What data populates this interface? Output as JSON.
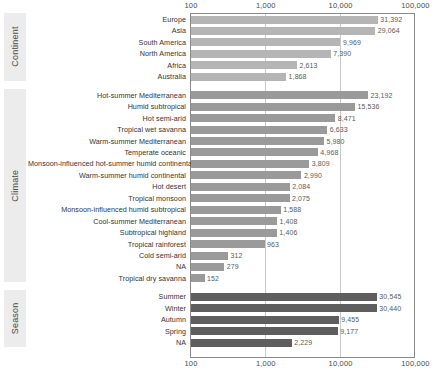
{
  "chart_data": {
    "type": "bar",
    "orientation": "horizontal",
    "title": "",
    "xlabel": "",
    "ylabel": "",
    "xscale": "log",
    "xlim": [
      100,
      100000
    ],
    "grid": true,
    "axis_ticks": [
      "100",
      "1,000",
      "10,000",
      "100,000"
    ],
    "axis_tick_values": [
      100,
      1000,
      10000,
      100000
    ],
    "groups": [
      {
        "name": "Continent",
        "bar_color": "#b5b5b5",
        "categories": [
          "Europe",
          "Asia",
          "South America",
          "North America",
          "Africa",
          "Australia"
        ],
        "values": [
          31392,
          29064,
          9969,
          7390,
          2613,
          1868
        ],
        "value_labels": [
          "31,392",
          "29,064",
          "9,969",
          "7,390",
          "2,613",
          "1,868"
        ]
      },
      {
        "name": "Climate",
        "bar_color": "#9a9a9a",
        "categories": [
          "Hot-summer Mediterranean",
          "Humid subtropical",
          "Hot semi-arid",
          "Tropical wet savanna",
          "Warm-summer Mediterranean",
          "Temperate oceanic",
          "Monsoon-influenced hot-summer humid continental",
          "Warm-summer humid continental",
          "Hot desert",
          "Tropical monsoon",
          "Monsoon-influenced humid subtropical",
          "Cool-summer Mediterranean",
          "Subtropical highland",
          "Tropical rainforest",
          "Cold semi-arid",
          "NA",
          "Tropical dry savanna"
        ],
        "values": [
          23192,
          15536,
          8471,
          6633,
          5980,
          4968,
          3809,
          2990,
          2084,
          2075,
          1588,
          1408,
          1406,
          963,
          312,
          279,
          152
        ],
        "value_labels": [
          "23,192",
          "15,536",
          "8,471",
          "6,633",
          "5,980",
          "4,968",
          "3,809",
          "2,990",
          "2,084",
          "2,075",
          "1,588",
          "1,408",
          "1,406",
          "963",
          "312",
          "279",
          "152"
        ]
      },
      {
        "name": "Season",
        "bar_color": "#5e5e5e",
        "categories": [
          "Summer",
          "Winter",
          "Autumn",
          "Spring",
          "NA"
        ],
        "values": [
          30545,
          30440,
          9455,
          9177,
          2229
        ],
        "value_labels": [
          "30,545",
          "30,440",
          "9,455",
          "9,177",
          "2,229"
        ]
      }
    ]
  }
}
